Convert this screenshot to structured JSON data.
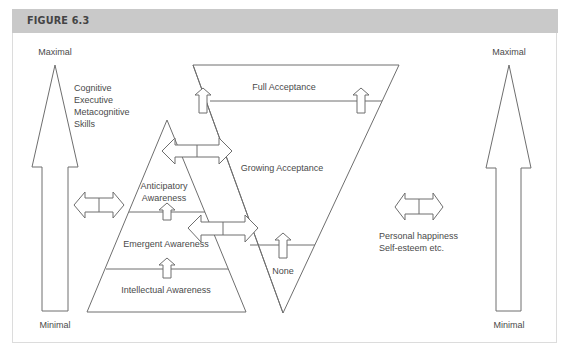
{
  "figure": {
    "title": "FIGURE 6.3"
  },
  "left_scale": {
    "top_label": "Maximal",
    "bottom_label": "Minimal",
    "description": "Cognitive\nExecutive\nMetacognitive\nSkills"
  },
  "right_scale": {
    "top_label": "Maximal",
    "bottom_label": "Minimal",
    "description": "Personal happiness\nSelf-esteem etc."
  },
  "awareness_pyramid": {
    "levels": [
      {
        "label": "Anticipatory\nAwareness"
      },
      {
        "label": "Emergent Awareness"
      },
      {
        "label": "Intellectual Awareness"
      }
    ]
  },
  "acceptance_triangle": {
    "levels": [
      {
        "label": "Full Acceptance"
      },
      {
        "label": "Growing Acceptance"
      },
      {
        "label": "None"
      }
    ]
  },
  "colors": {
    "header_bg": "#c9c9c9",
    "stroke": "#6e6e6e",
    "text": "#4a4a4a",
    "frame_border": "#dcdcdc"
  }
}
